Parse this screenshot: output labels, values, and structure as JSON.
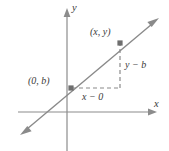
{
  "figure": {
    "kind": "coordinate-plane-line-diagram",
    "topic": "slope of a line through the y-intercept and a general point",
    "width": 169,
    "height": 151,
    "background_color": "#ffffff",
    "line_color": "#8a8a8a",
    "axis_color": "#8c8c8c",
    "dashed_color": "#8a8a8a",
    "text_color": "#3a3a3a",
    "marker_color": "#6e6e6e"
  },
  "axes": {
    "x_label": "x",
    "y_label": "y",
    "origin": {
      "x": 67,
      "y": 112
    },
    "x_axis": {
      "start_x": 18,
      "end_x": 155,
      "y": 112,
      "arrow": "right"
    },
    "y_axis": {
      "x": 67,
      "start_y": 10,
      "end_y": 151,
      "arrow": "up"
    }
  },
  "line": {
    "arrows": "both",
    "start": {
      "x": 22,
      "y": 133
    },
    "end": {
      "x": 158,
      "y": 19
    }
  },
  "points": [
    {
      "label": "(0, b)",
      "name": "y-intercept-point",
      "px": {
        "x": 71,
        "y": 88
      }
    },
    {
      "label": "(x, y)",
      "name": "general-point",
      "px": {
        "x": 120,
        "y": 43
      }
    }
  ],
  "legs": [
    {
      "name": "run",
      "label": "x − 0",
      "orientation": "horizontal",
      "from": {
        "x": 71,
        "y": 88
      },
      "to": {
        "x": 120,
        "y": 88
      },
      "style": "dashed"
    },
    {
      "name": "rise",
      "label": "y − b",
      "orientation": "vertical",
      "from": {
        "x": 120,
        "y": 88
      },
      "to": {
        "x": 120,
        "y": 43
      },
      "style": "dashed"
    }
  ]
}
